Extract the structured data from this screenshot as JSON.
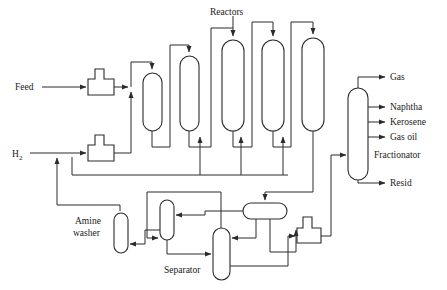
{
  "diagram": {
    "type": "process-flow-diagram",
    "background_color": "#ffffff",
    "line_color": "#2b2b2b"
  },
  "labels": {
    "feed": "Feed",
    "hydrogen": "H",
    "hydrogen_sub": "2",
    "reactors": "Reactors",
    "amine_washer_line1": "Amine",
    "amine_washer_line2": "washer",
    "separator": "Separator",
    "fractionator": "Fractionator",
    "gas": "Gas",
    "naphtha": "Naphtha",
    "kerosene": "Kerosene",
    "gas_oil": "Gas oil",
    "resid": "Resid"
  },
  "equipment": [
    {
      "name": "feed-pump",
      "kind": "pump",
      "x": 88,
      "y": 67,
      "w": 26,
      "h": 28
    },
    {
      "name": "hydrogen-pump",
      "kind": "pump",
      "x": 88,
      "y": 133,
      "w": 26,
      "h": 28
    },
    {
      "name": "reactor-1",
      "kind": "vertical-vessel",
      "x": 143,
      "y": 73,
      "w": 19,
      "h": 58
    },
    {
      "name": "reactor-2",
      "kind": "vertical-vessel",
      "x": 180,
      "y": 56,
      "w": 19,
      "h": 75
    },
    {
      "name": "reactor-3",
      "kind": "vertical-vessel",
      "x": 222,
      "y": 40,
      "w": 22,
      "h": 91
    },
    {
      "name": "reactor-4",
      "kind": "vertical-vessel",
      "x": 262,
      "y": 40,
      "w": 22,
      "h": 91
    },
    {
      "name": "reactor-5",
      "kind": "vertical-vessel",
      "x": 302,
      "y": 38,
      "w": 22,
      "h": 93
    },
    {
      "name": "fractionator-column",
      "kind": "vertical-vessel",
      "x": 348,
      "y": 88,
      "w": 20,
      "h": 92
    },
    {
      "name": "amine-washer-column",
      "kind": "vertical-vessel",
      "x": 114,
      "y": 213,
      "w": 14,
      "h": 40
    },
    {
      "name": "stripper-column",
      "kind": "vertical-vessel",
      "x": 160,
      "y": 200,
      "w": 14,
      "h": 40
    },
    {
      "name": "separator-column",
      "kind": "vertical-vessel",
      "x": 213,
      "y": 228,
      "w": 17,
      "h": 52
    },
    {
      "name": "overhead-drum",
      "kind": "horizontal-drum",
      "x": 243,
      "y": 203,
      "w": 44,
      "h": 16
    },
    {
      "name": "bottoms-pump",
      "kind": "pump",
      "x": 297,
      "y": 216,
      "w": 24,
      "h": 27
    }
  ],
  "products": [
    {
      "name": "gas",
      "label": "Gas",
      "y": 77
    },
    {
      "name": "naphtha",
      "label": "Naphtha",
      "y": 107
    },
    {
      "name": "kerosene",
      "label": "Kerosene",
      "y": 122
    },
    {
      "name": "gas-oil",
      "label": "Gas oil",
      "y": 137
    },
    {
      "name": "resid",
      "label": "Resid",
      "y": 183
    }
  ],
  "streams": [
    {
      "name": "feed-inlet",
      "from": "Feed",
      "to": "feed-pump"
    },
    {
      "name": "hydrogen-inlet",
      "from": "H2",
      "to": "hydrogen-pump"
    },
    {
      "name": "reactor-feed-header",
      "from": "feed-pump",
      "to": "reactor-1"
    },
    {
      "name": "hydrogen-header",
      "from": "hydrogen-pump",
      "to": "reactors"
    },
    {
      "name": "reactor-interstage",
      "from": "reactor-n",
      "to": "reactor-n+1"
    },
    {
      "name": "reactor-effluent",
      "from": "reactor-5",
      "to": "overhead-drum"
    },
    {
      "name": "separator-to-fractionator",
      "from": "bottoms-pump",
      "to": "fractionator-column"
    },
    {
      "name": "recycle-gas",
      "from": "amine-washer-column",
      "to": "hydrogen-header"
    }
  ]
}
